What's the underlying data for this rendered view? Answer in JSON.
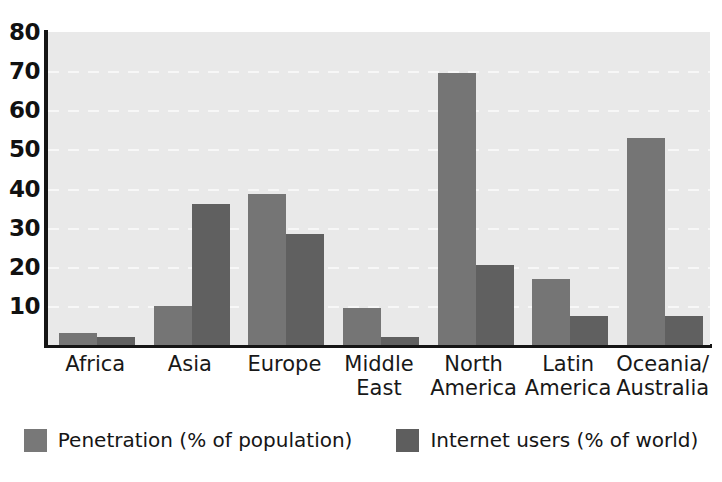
{
  "chart_data": {
    "type": "bar",
    "title": "",
    "xlabel": "",
    "ylabel": "",
    "ylim": [
      0,
      80
    ],
    "yticks": [
      10,
      20,
      30,
      40,
      50,
      60,
      70,
      80
    ],
    "grid": true,
    "legend_position": "bottom",
    "categories": [
      "Africa",
      "Asia",
      "Europe",
      "Middle\nEast",
      "North\nAmerica",
      "Latin\nAmerica",
      "Oceania/\nAustralia"
    ],
    "series": [
      {
        "name": "Penetration (% of population)",
        "color": "#757575",
        "values": [
          3.0,
          10.0,
          38.5,
          9.5,
          69.5,
          17.0,
          53.0
        ]
      },
      {
        "name": "Internet users (% of world)",
        "color": "#606060",
        "values": [
          2.0,
          36.0,
          28.5,
          2.0,
          20.5,
          7.5,
          7.5
        ]
      }
    ]
  },
  "axis": {
    "y_tick_labels": [
      "80",
      "70",
      "60",
      "50",
      "40",
      "30",
      "20",
      "10"
    ]
  },
  "legend": {
    "items": [
      {
        "label": "Penetration (% of population)",
        "swatch": "legend-swatch-penetration"
      },
      {
        "label": "Internet users (% of world)",
        "swatch": "legend-swatch-internet-users"
      }
    ]
  },
  "colors": {
    "plot_background": "#e9e9e9",
    "page_background": "#ffffff",
    "axis": "#151515",
    "gridline": "#f7f7f7",
    "series_penetration": "#757575",
    "series_internet_users": "#606060",
    "text": "#151515"
  }
}
